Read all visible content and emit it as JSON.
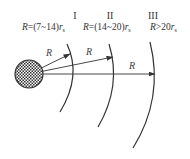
{
  "diagram": {
    "type": "concentric-zones",
    "center": {
      "label": "particle",
      "fill_pattern": "crosshatch"
    },
    "zones": [
      {
        "numeral": "I",
        "formula_prefix": "R=(7~14)",
        "formula_var": "r",
        "formula_sub": "s"
      },
      {
        "numeral": "II",
        "formula_prefix": "R=(14~20)",
        "formula_var": "r",
        "formula_sub": "s"
      },
      {
        "numeral": "III",
        "formula_prefix": "R>20",
        "formula_var": "r",
        "formula_sub": "s"
      }
    ],
    "arrows": [
      {
        "label": "R"
      },
      {
        "label": "R"
      },
      {
        "label": "R"
      }
    ],
    "colors": {
      "line": "#333333",
      "background": "#ffffff"
    }
  }
}
